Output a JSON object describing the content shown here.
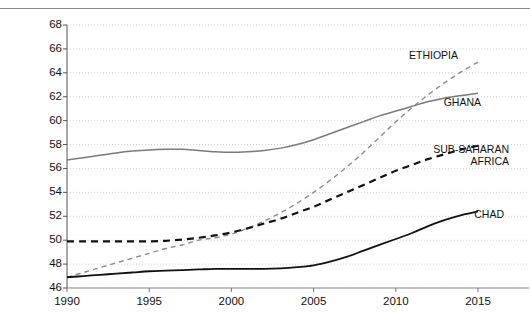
{
  "chart_data": {
    "type": "line",
    "title": "",
    "subtitle": "",
    "xlabel": "",
    "ylabel": "",
    "xlim": [
      1990,
      2015
    ],
    "ylim": [
      46,
      68
    ],
    "grid": true,
    "grid_style": "dotted-horizontal",
    "legend_position": "inline-right",
    "x_ticks": [
      "1990",
      "1995",
      "2000",
      "2005",
      "2010",
      "2015"
    ],
    "y_ticks": [
      "46",
      "48",
      "50",
      "52",
      "54",
      "56",
      "58",
      "60",
      "62",
      "64",
      "66",
      "68"
    ],
    "x": [
      1990,
      1991,
      1992,
      1993,
      1994,
      1995,
      1996,
      1997,
      1998,
      1999,
      2000,
      2001,
      2002,
      2003,
      2004,
      2005,
      2006,
      2007,
      2008,
      2009,
      2010,
      2011,
      2012,
      2013,
      2014,
      2015
    ],
    "series": [
      {
        "name": "ETHIOPIA",
        "label": "ETHIOPIA",
        "color": "#8c8c8c",
        "style": "dashed",
        "width": 1.4,
        "values": [
          46.9,
          47.3,
          47.7,
          48.1,
          48.5,
          48.9,
          49.3,
          49.6,
          50.0,
          50.2,
          50.5,
          51.0,
          51.6,
          52.3,
          53.1,
          54.0,
          55.0,
          56.1,
          57.3,
          58.6,
          59.9,
          61.1,
          62.2,
          63.2,
          64.1,
          64.9
        ],
        "label_pos": {
          "x": 458,
          "y": 49
        }
      },
      {
        "name": "GHANA",
        "label": "GHANA",
        "color": "#7a7a7a",
        "style": "solid",
        "width": 1.5,
        "values": [
          56.7,
          56.9,
          57.1,
          57.3,
          57.45,
          57.55,
          57.6,
          57.6,
          57.5,
          57.4,
          57.35,
          57.4,
          57.5,
          57.7,
          58.0,
          58.4,
          58.9,
          59.4,
          59.9,
          60.4,
          60.8,
          61.2,
          61.6,
          61.9,
          62.1,
          62.3
        ],
        "label_pos": {
          "x": 481,
          "y": 96
        }
      },
      {
        "name": "SUB-SAHARAN AFRICA",
        "label": "SUB-SAHARAN",
        "label_line2": "AFRICA",
        "color": "#111111",
        "style": "dashed",
        "width": 2.2,
        "values": [
          49.9,
          49.9,
          49.9,
          49.9,
          49.9,
          49.9,
          49.95,
          50.05,
          50.2,
          50.4,
          50.65,
          51.0,
          51.4,
          51.8,
          52.3,
          52.8,
          53.4,
          54.0,
          54.6,
          55.2,
          55.8,
          56.3,
          56.8,
          57.2,
          57.6,
          57.9
        ],
        "label_pos": {
          "x": 509,
          "y": 143
        }
      },
      {
        "name": "CHAD",
        "label": "CHAD",
        "color": "#111111",
        "style": "solid",
        "width": 1.8,
        "values": [
          46.9,
          47.0,
          47.1,
          47.2,
          47.3,
          47.4,
          47.45,
          47.5,
          47.55,
          47.6,
          47.6,
          47.6,
          47.6,
          47.65,
          47.75,
          47.9,
          48.2,
          48.6,
          49.1,
          49.6,
          50.1,
          50.6,
          51.2,
          51.7,
          52.1,
          52.4
        ],
        "label_pos": {
          "x": 504,
          "y": 208
        }
      }
    ]
  },
  "axes": {
    "y_axis_name": "y-axis",
    "x_axis_name": "x-axis"
  }
}
